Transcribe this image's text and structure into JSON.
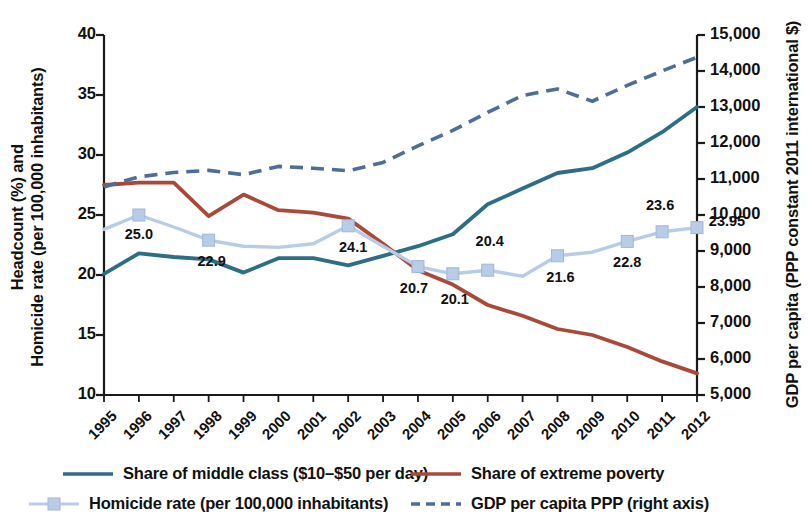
{
  "chart_data": {
    "type": "line",
    "title": "",
    "x": [
      1995,
      1996,
      1997,
      1998,
      1999,
      2000,
      2001,
      2002,
      2003,
      2004,
      2005,
      2006,
      2007,
      2008,
      2009,
      2010,
      2011,
      2012
    ],
    "xlabel": "",
    "xtick_labels": [
      "1995",
      "1996",
      "1997",
      "1998",
      "1999",
      "2000",
      "2001",
      "2002",
      "2003",
      "2004",
      "2005",
      "2006",
      "2007",
      "2008",
      "2009",
      "2010",
      "2011",
      "2012"
    ],
    "ylabel_left": "Headcount (%) and Homicide rate (per 100,000 inhabitants)",
    "ylabel_left_lines": [
      "Headcount (%) and",
      "Homicide rate (per 100,000 inhabitants)"
    ],
    "ylim_left": [
      10,
      40
    ],
    "ytick_labels_left": [
      "40",
      "35",
      "30",
      "25",
      "20",
      "15",
      "10"
    ],
    "ytick_values_left": [
      40,
      35,
      30,
      25,
      20,
      15,
      10
    ],
    "ylabel_right": "GDP per capita (PPP constant 2011 international $)",
    "ylim_right": [
      5000,
      15000
    ],
    "ytick_labels_right": [
      "15,000",
      "14,000",
      "13,000",
      "12,000",
      "11,000",
      "10,000",
      "9,000",
      "8,000",
      "7,000",
      "6,000",
      "5,000"
    ],
    "ytick_values_right": [
      15000,
      14000,
      13000,
      12000,
      11000,
      10000,
      9000,
      8000,
      7000,
      6000,
      5000
    ],
    "grid": false,
    "legend_position": "bottom",
    "series": [
      {
        "name": "Share of middle class ($10–$50 per day)",
        "key": "middle_class",
        "axis": "left",
        "style": "solid",
        "color": "#2E6E84",
        "values": [
          20.1,
          21.8,
          21.5,
          21.3,
          20.2,
          21.4,
          21.4,
          20.8,
          21.6,
          22.4,
          23.4,
          25.9,
          27.2,
          28.5,
          28.9,
          30.2,
          31.9,
          34.0
        ]
      },
      {
        "name": "Share of extreme poverty",
        "key": "extreme_poverty",
        "axis": "left",
        "style": "solid",
        "color": "#A94A38",
        "values": [
          27.5,
          27.7,
          27.7,
          24.9,
          26.7,
          25.4,
          25.2,
          24.7,
          22.6,
          20.4,
          19.2,
          17.5,
          16.6,
          15.5,
          15.0,
          14.0,
          12.8,
          11.8
        ]
      },
      {
        "name": "Homicide rate (per 100,000 inhabitants)",
        "key": "homicide_rate",
        "axis": "left",
        "style": "solid-marker",
        "color": "#B8CCE8",
        "values": [
          23.8,
          25.0,
          24.0,
          22.9,
          22.4,
          22.3,
          22.6,
          24.1,
          22.4,
          20.7,
          20.1,
          20.4,
          19.9,
          21.6,
          21.9,
          22.8,
          23.6,
          23.95
        ],
        "marker_years": [
          1996,
          1998,
          2002,
          2004,
          2005,
          2006,
          2008,
          2010,
          2011,
          2012
        ],
        "data_labels": [
          {
            "year": 1996,
            "text": "25.0"
          },
          {
            "year": 1998,
            "text": "22.9"
          },
          {
            "year": 2002,
            "text": "24.1"
          },
          {
            "year": 2004,
            "text": "20.7"
          },
          {
            "year": 2005,
            "text": "20.1"
          },
          {
            "year": 2006,
            "text": "20.4"
          },
          {
            "year": 2008,
            "text": "21.6"
          },
          {
            "year": 2010,
            "text": "22.8"
          },
          {
            "year": 2011,
            "text": "23.6"
          },
          {
            "year": 2012,
            "text": "23.95"
          }
        ]
      },
      {
        "name": "GDP per capita PPP (right axis)",
        "key": "gdp_per_capita",
        "axis": "right",
        "style": "dashed",
        "color": "#4E6E97",
        "values": [
          10780,
          11060,
          11180,
          11240,
          11120,
          11350,
          11300,
          11230,
          11460,
          11920,
          12350,
          12850,
          13320,
          13500,
          13160,
          13600,
          14000,
          14380
        ]
      }
    ]
  },
  "legend": {
    "items": [
      {
        "label": "Share of middle class ($10–$50 per day)",
        "series": "middle_class"
      },
      {
        "label": "Share of extreme poverty",
        "series": "extreme_poverty"
      },
      {
        "label": "Homicide rate (per 100,000 inhabitants)",
        "series": "homicide_rate"
      },
      {
        "label": "GDP per capita PPP (right axis)",
        "series": "gdp_per_capita"
      }
    ]
  },
  "colors": {
    "middle_class": "#2E6E84",
    "extreme_poverty": "#A94A38",
    "homicide_rate": "#B8CCE8",
    "gdp_per_capita": "#4E6E97",
    "axis": "#1a1a1a",
    "text": "#111111"
  }
}
